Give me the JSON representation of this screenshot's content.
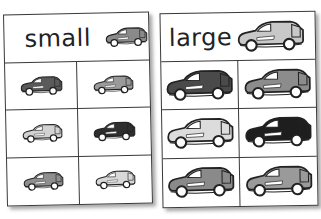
{
  "cards": [
    {
      "id": "small",
      "title": "small",
      "header_car": {
        "color": "#8a8a8a",
        "size": "small"
      },
      "cars": [
        {
          "color": "#5a5a5a"
        },
        {
          "color": "#9a9a9a"
        },
        {
          "color": "#d2d2d2"
        },
        {
          "color": "#2e2e2e"
        },
        {
          "color": "#8e8e8e"
        },
        {
          "color": "#d8d8d8"
        }
      ]
    },
    {
      "id": "large",
      "title": "large",
      "header_car": {
        "color": "#c8c8c8",
        "size": "large"
      },
      "cars": [
        {
          "color": "#4a4a4a"
        },
        {
          "color": "#8c8c8c"
        },
        {
          "color": "#dcdcdc"
        },
        {
          "color": "#1e1e1e"
        },
        {
          "color": "#8a8a8a"
        },
        {
          "color": "#9a9a9a"
        }
      ]
    }
  ]
}
